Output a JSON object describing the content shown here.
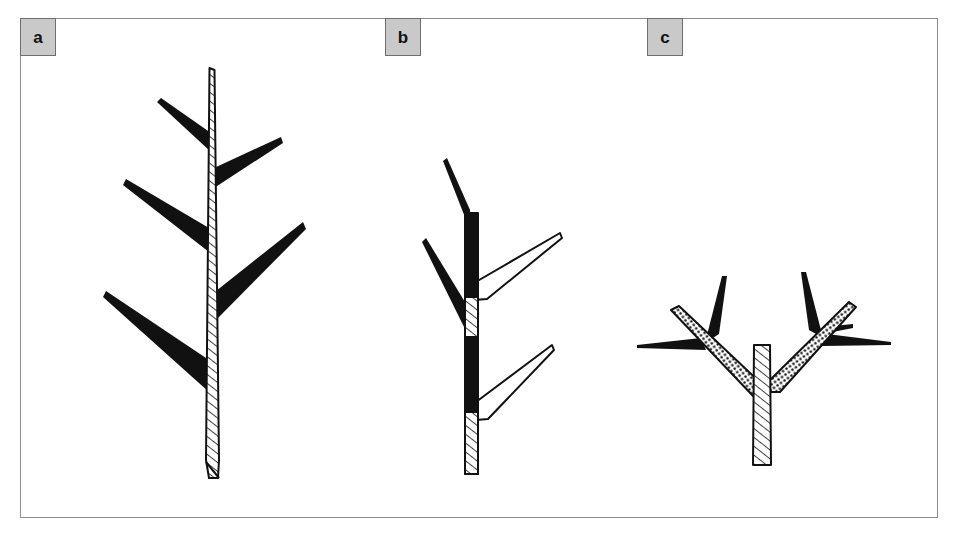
{
  "figure": {
    "background_color": "#ffffff",
    "frame": {
      "x": 20,
      "y": 18,
      "width": 918,
      "height": 500,
      "border_color": "#8d8d8d"
    },
    "label_box": {
      "fill": "#c9c9c9",
      "border": "#6e6e6e",
      "text_color": "#111111",
      "width": 36,
      "height": 38
    },
    "ink_color": "#111111",
    "panels": [
      {
        "id": "a",
        "label": "a",
        "description": "monopodial-axis-with-alternating-lateral-branches",
        "stem_fill": "hatched",
        "branch_fill": "solid-black",
        "branch_count": 5
      },
      {
        "id": "b",
        "label": "b",
        "description": "axis-with-mixed-black-and-hatched-internodes",
        "stem_fill": "black-and-hatched",
        "branch_fill": "solid-black-and-outlined",
        "branch_count": 4
      },
      {
        "id": "c",
        "label": "c",
        "description": "dichotomous-fork-with-stippled-arms-and-needle-branches",
        "stem_fill": "hatched",
        "arm_fill": "stippled",
        "branch_fill": "solid-black",
        "branch_count": 6
      }
    ]
  }
}
